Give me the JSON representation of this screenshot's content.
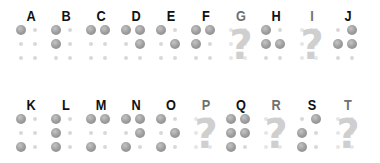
{
  "chart_title": "Braille alphabet A–T",
  "colors": {
    "letter_known": "#111111",
    "letter_unknown": "#707070",
    "dot_raised": "#9a9a9a",
    "dot_flat": "#d8d8d8",
    "question_mark": "#cfcfcf"
  },
  "rows": [
    {
      "cells": [
        {
          "letter": "A",
          "known": true,
          "dots": [
            1,
            0,
            0,
            0,
            0,
            0
          ]
        },
        {
          "letter": "B",
          "known": true,
          "dots": [
            1,
            0,
            1,
            0,
            0,
            0
          ]
        },
        {
          "letter": "C",
          "known": true,
          "dots": [
            1,
            1,
            0,
            0,
            0,
            0
          ]
        },
        {
          "letter": "D",
          "known": true,
          "dots": [
            1,
            1,
            0,
            1,
            0,
            0
          ]
        },
        {
          "letter": "E",
          "known": true,
          "dots": [
            1,
            0,
            0,
            1,
            0,
            0
          ]
        },
        {
          "letter": "F",
          "known": true,
          "dots": [
            1,
            1,
            1,
            0,
            0,
            0
          ]
        },
        {
          "letter": "G",
          "known": false,
          "symbol": "?"
        },
        {
          "letter": "H",
          "known": true,
          "dots": [
            1,
            0,
            1,
            1,
            0,
            0
          ]
        },
        {
          "letter": "I",
          "known": false,
          "symbol": "?"
        },
        {
          "letter": "J",
          "known": true,
          "dots": [
            0,
            1,
            1,
            1,
            0,
            0
          ]
        }
      ]
    },
    {
      "cells": [
        {
          "letter": "K",
          "known": true,
          "dots": [
            1,
            0,
            0,
            0,
            1,
            0
          ]
        },
        {
          "letter": "L",
          "known": true,
          "dots": [
            1,
            0,
            1,
            0,
            1,
            0
          ]
        },
        {
          "letter": "M",
          "known": true,
          "dots": [
            1,
            1,
            0,
            0,
            1,
            0
          ]
        },
        {
          "letter": "N",
          "known": true,
          "dots": [
            1,
            1,
            0,
            1,
            1,
            0
          ]
        },
        {
          "letter": "O",
          "known": true,
          "dots": [
            1,
            0,
            0,
            1,
            1,
            0
          ]
        },
        {
          "letter": "P",
          "known": false,
          "symbol": "?"
        },
        {
          "letter": "Q",
          "known": true,
          "dots": [
            1,
            1,
            1,
            1,
            1,
            0
          ]
        },
        {
          "letter": "R",
          "known": false,
          "symbol": "?"
        },
        {
          "letter": "S",
          "known": true,
          "dots": [
            0,
            1,
            1,
            0,
            1,
            0
          ]
        },
        {
          "letter": "T",
          "known": false,
          "symbol": "?"
        }
      ]
    }
  ]
}
